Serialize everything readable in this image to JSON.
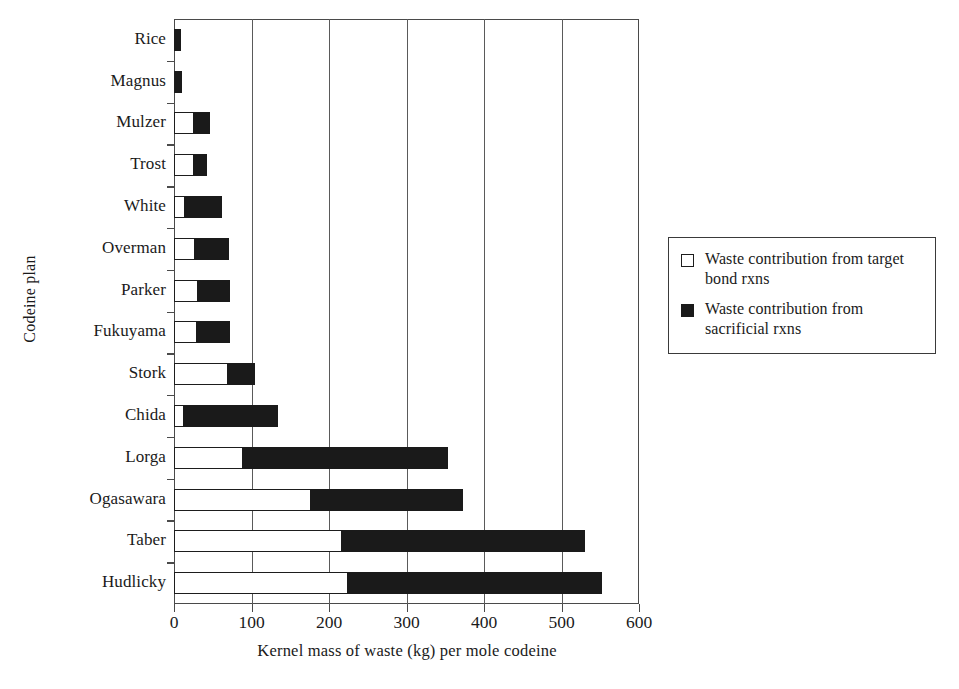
{
  "chart_data": {
    "type": "bar",
    "orientation": "horizontal",
    "stacked": true,
    "title": "",
    "xlabel": "Kernel mass of waste (kg) per mole codeine",
    "ylabel": "Codeine plan",
    "xlim": [
      0,
      600
    ],
    "xticks": [
      0,
      100,
      200,
      300,
      400,
      500,
      600
    ],
    "xticklabels": [
      "0",
      "100",
      "200",
      "300",
      "400",
      "500",
      "600"
    ],
    "grid": "vertical",
    "legend_position": "right",
    "categories": [
      "Rice",
      "Magnus",
      "Mulzer",
      "Trost",
      "White",
      "Overman",
      "Parker",
      "Fukuyama",
      "Stork",
      "Chida",
      "Lorga",
      "Ogasawara",
      "Taber",
      "Hudlicky"
    ],
    "series": [
      {
        "name": "Waste contribution from target bond rxns",
        "color": "#ffffff",
        "edge_color": "#1d1d1d",
        "values": [
          2,
          3,
          27,
          27,
          15,
          28,
          32,
          31,
          70,
          14,
          90,
          177,
          218,
          225
        ]
      },
      {
        "name": "Waste contribution from sacrificial rxns",
        "color": "#1a1a1a",
        "edge_color": "#1a1a1a",
        "values": [
          7,
          7,
          19,
          16,
          47,
          43,
          40,
          41,
          34,
          120,
          264,
          196,
          312,
          327
        ]
      }
    ],
    "totals": [
      9,
      10,
      46,
      43,
      62,
      71,
      72,
      72,
      104,
      134,
      354,
      373,
      530,
      552
    ]
  },
  "legend": {
    "entries": [
      {
        "swatch": "open-square-swatch",
        "label": "Waste contribution from target bond rxns"
      },
      {
        "swatch": "filled-square-swatch",
        "label": "Waste contribution from sacrificial rxns"
      }
    ]
  }
}
